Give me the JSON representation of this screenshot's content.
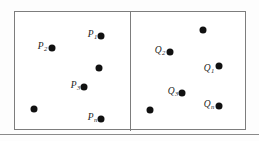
{
  "figure": {
    "frame_color": "#7d7d7d",
    "dot_color": "#111111",
    "background_color": "#ffffff"
  },
  "left_cell": {
    "name": "P-set cell",
    "points": [
      {
        "id": "p1",
        "label": "P",
        "sub": "1",
        "has_label": true,
        "cx": 101,
        "cy": 36,
        "lx": 97,
        "ly": 35
      },
      {
        "id": "p2",
        "label": "P",
        "sub": "2",
        "has_label": true,
        "cx": 52,
        "cy": 48,
        "lx": 47,
        "ly": 47
      },
      {
        "id": "p-unlabeled-a",
        "label": "",
        "sub": "",
        "has_label": false,
        "cx": 99,
        "cy": 68,
        "lx": 0,
        "ly": 0
      },
      {
        "id": "p3",
        "label": "P",
        "sub": "3",
        "has_label": true,
        "cx": 84,
        "cy": 87,
        "lx": 80,
        "ly": 86
      },
      {
        "id": "p-unlabeled-b",
        "label": "",
        "sub": "",
        "has_label": false,
        "cx": 34,
        "cy": 109,
        "lx": 0,
        "ly": 0
      },
      {
        "id": "pn",
        "label": "P",
        "sub": "n",
        "has_label": true,
        "cx": 101,
        "cy": 119,
        "lx": 97,
        "ly": 118
      }
    ]
  },
  "right_cell": {
    "name": "Q-set cell",
    "points": [
      {
        "id": "q-unlabeled-a",
        "label": "",
        "sub": "",
        "has_label": false,
        "cx": 203,
        "cy": 30,
        "lx": 0,
        "ly": 0
      },
      {
        "id": "q2",
        "label": "Q",
        "sub": "2",
        "has_label": true,
        "cx": 170,
        "cy": 52,
        "lx": 165,
        "ly": 51
      },
      {
        "id": "q1",
        "label": "Q",
        "sub": "1",
        "has_label": true,
        "cx": 219,
        "cy": 66,
        "lx": 214,
        "ly": 69
      },
      {
        "id": "q3",
        "label": "Q",
        "sub": "3",
        "has_label": true,
        "cx": 182,
        "cy": 93,
        "lx": 178,
        "ly": 92
      },
      {
        "id": "q-unlabeled-b",
        "label": "",
        "sub": "",
        "has_label": false,
        "cx": 150,
        "cy": 110,
        "lx": 0,
        "ly": 0
      },
      {
        "id": "qn",
        "label": "Q",
        "sub": "n",
        "has_label": true,
        "cx": 219,
        "cy": 106,
        "lx": 214,
        "ly": 105
      }
    ]
  }
}
